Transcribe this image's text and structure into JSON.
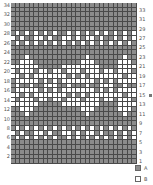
{
  "chart_title": "",
  "grid": {
    "rows": 34,
    "cols": 27,
    "colors": {
      "A": "#8c8c8c",
      "B": "#ffffff",
      "grid_line": "#4a4a4a"
    },
    "pattern_rows_top_to_bottom": [
      "AAAAAAAAAAAAAAAAAAAAAAAAAAA",
      "AAAAAAAAAAAAAAAAAAAAAAAAAAA",
      "AAAAAAAAAAAAAAAAAAAAAAAAAAA",
      "AAAAAAAAAAAAAAAAAAAAAAAAAAA",
      "AAAAAAAAAAAAAAAAAAAAAAAAAAA",
      "AAAAAAAAAAAAAAAAAAAAAAAAAAA",
      "ABABABABABAABABABABABABABAB",
      "BABAABBABAABBABABBABAABABAB",
      "ABABABABABABABABABABABABABA",
      "AAAAAAAAAAAAAAAAAAAAAAAAAAA",
      "AAAAAAAAAAAAAAAAAAAAAAAAAAA",
      "AAABAAAAAAAAAAAABAAAAAAABAA",
      "AABBBAAAAAAAAAABBBAAAAABBBA",
      "BBBBBBAAAAABBBBBBBBAAAABBBB",
      "BABBBABBABBABBBABBBABBABBBA",
      "BBABABBBBBBBABABABBBBBBBABB",
      "ABBBBBABABABBBBBBBABABABBBB",
      "ABAABAABBBAABAAABAABBBAABAA",
      "ABBBBBABABABBBBBBBABABABBBB",
      "BBABABBBBBBBABABABBBBBBBABB",
      "BABBBABBABBABBBABBBABBABBBA",
      "BBBBBBAAAAABBBBBBBBAAAABBBB",
      "AABBBAAAAAAAAAABBBAAAAABBBA",
      "AAABAAAAAAAAAAAABAAAAAAABAA",
      "AAAAAAAAAAAAAAAAAAAAAAAAAAA",
      "AAAAAAAAAAAAAAAAAAAAAAAAAAA",
      "ABABABABABABABABABABABABABA",
      "BABAABBABAABBABABBABAABABAB",
      "ABABABABABAABABABABABABABAB",
      "AAAAAAAAAAAAAAAAAAAAAAAAAAA",
      "AAAAAAAAAAAAAAAAAAAAAAAAAAA",
      "AAAAAAAAAAAAAAAAAAAAAAAAAAA",
      "AAAAAAAAAAAAAAAAAAAAAAAAAAA",
      "AAAAAAAAAAAAAAAAAAAAAAAAAAA"
    ]
  },
  "row_labels": {
    "left_even": [
      "34",
      "32",
      "30",
      "28",
      "26",
      "24",
      "22",
      "20",
      "18",
      "16",
      "14",
      "12",
      "10",
      "8",
      "6",
      "4",
      "2"
    ],
    "right_odd": [
      "33",
      "31",
      "29",
      "27",
      "25",
      "23",
      "21",
      "19",
      "17",
      "15",
      "13",
      "11",
      "9",
      "7",
      "5",
      "3",
      "1"
    ]
  },
  "center_marker_row": "15",
  "legend": [
    {
      "key": "A",
      "label": "A",
      "color": "#8c8c8c"
    },
    {
      "key": "B",
      "label": "B",
      "color": "#ffffff"
    }
  ]
}
